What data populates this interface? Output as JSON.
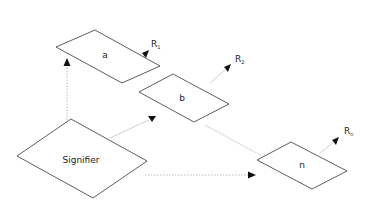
{
  "diagram": {
    "nodes": [
      {
        "id": "a",
        "label": "a"
      },
      {
        "id": "b",
        "label": "b"
      },
      {
        "id": "n",
        "label": "n"
      },
      {
        "id": "signifier",
        "label": "Signifier"
      }
    ],
    "outputs": [
      {
        "id": "r1",
        "base": "R",
        "sub": "1"
      },
      {
        "id": "r2",
        "base": "R",
        "sub": "2"
      },
      {
        "id": "rn",
        "base": "R",
        "sub": "n"
      }
    ],
    "edges": [
      {
        "from": "signifier",
        "to": "a",
        "style": "dotted"
      },
      {
        "from": "signifier",
        "to": "b",
        "style": "solid-light"
      },
      {
        "from": "signifier",
        "to": "n",
        "style": "dotted"
      },
      {
        "from": "b",
        "to": "n",
        "style": "solid-light"
      },
      {
        "from": "a",
        "to": "r1",
        "style": "solid-light"
      },
      {
        "from": "b",
        "to": "r2",
        "style": "solid-light"
      },
      {
        "from": "n",
        "to": "rn",
        "style": "solid-light"
      }
    ],
    "colors": {
      "stroke": "#333333",
      "edge": "#c8c8c8",
      "arrow": "#111111"
    }
  }
}
